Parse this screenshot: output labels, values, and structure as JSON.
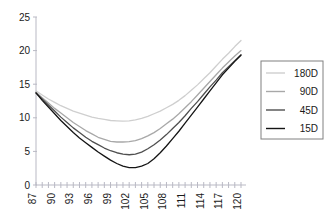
{
  "chart_data": {
    "type": "line",
    "title": "",
    "xlabel": "",
    "ylabel": "",
    "xlim": [
      87,
      120
    ],
    "ylim": [
      0,
      25
    ],
    "yticks": [
      0,
      5,
      10,
      15,
      20,
      25
    ],
    "ytick_labels": [
      "0",
      "5",
      "10",
      "15",
      "20",
      "25"
    ],
    "xticks": [
      87,
      90,
      93,
      96,
      99,
      102,
      105,
      108,
      111,
      114,
      117,
      120
    ],
    "xtick_labels": [
      "87",
      "90",
      "93",
      "96",
      "99",
      "102",
      "105",
      "108",
      "111",
      "114",
      "117",
      "120"
    ],
    "x": [
      87,
      88,
      89,
      90,
      91,
      92,
      93,
      94,
      95,
      96,
      97,
      98,
      99,
      100,
      101,
      102,
      103,
      104,
      105,
      106,
      107,
      108,
      109,
      110,
      111,
      112,
      113,
      114,
      115,
      116,
      117,
      118,
      119,
      120
    ],
    "grid": false,
    "legend_position": "right",
    "series": [
      {
        "name": "180D",
        "color": "#cfcfcf",
        "values": [
          14.0,
          13.4,
          12.8,
          12.3,
          11.8,
          11.4,
          11.0,
          10.7,
          10.4,
          10.1,
          9.9,
          9.75,
          9.6,
          9.55,
          9.5,
          9.55,
          9.7,
          9.9,
          10.2,
          10.6,
          11.0,
          11.5,
          12.0,
          12.6,
          13.3,
          14.1,
          14.9,
          15.8,
          16.7,
          17.7,
          18.7,
          19.6,
          20.6,
          21.5
        ]
      },
      {
        "name": "90D",
        "color": "#a8a8a8",
        "values": [
          13.8,
          13.0,
          12.2,
          11.4,
          10.7,
          10.0,
          9.3,
          8.7,
          8.1,
          7.6,
          7.1,
          6.8,
          6.5,
          6.4,
          6.4,
          6.45,
          6.6,
          6.9,
          7.3,
          7.8,
          8.4,
          9.1,
          9.8,
          10.6,
          11.5,
          12.4,
          13.4,
          14.4,
          15.4,
          16.4,
          17.4,
          18.3,
          19.2,
          20.0
        ]
      },
      {
        "name": "45D",
        "color": "#4f4f4f",
        "values": [
          13.7,
          12.8,
          11.9,
          11.0,
          10.1,
          9.3,
          8.5,
          7.8,
          7.1,
          6.5,
          6.0,
          5.5,
          5.1,
          4.8,
          4.6,
          4.5,
          4.6,
          4.9,
          5.4,
          6.0,
          6.7,
          7.5,
          8.4,
          9.3,
          10.3,
          11.4,
          12.4,
          13.5,
          14.6,
          15.6,
          16.7,
          17.6,
          18.5,
          19.4
        ]
      },
      {
        "name": "15D",
        "color": "#141414",
        "values": [
          13.7,
          12.6,
          11.6,
          10.6,
          9.6,
          8.7,
          7.8,
          7.0,
          6.3,
          5.6,
          4.9,
          4.3,
          3.7,
          3.2,
          2.8,
          2.6,
          2.6,
          2.8,
          3.2,
          3.9,
          4.8,
          5.8,
          6.9,
          8.0,
          9.2,
          10.4,
          11.6,
          12.8,
          14.0,
          15.2,
          16.4,
          17.4,
          18.4,
          19.3
        ]
      }
    ]
  },
  "legend": {
    "entries": [
      {
        "label": "180D"
      },
      {
        "label": "90D"
      },
      {
        "label": "45D"
      },
      {
        "label": "15D"
      }
    ]
  }
}
